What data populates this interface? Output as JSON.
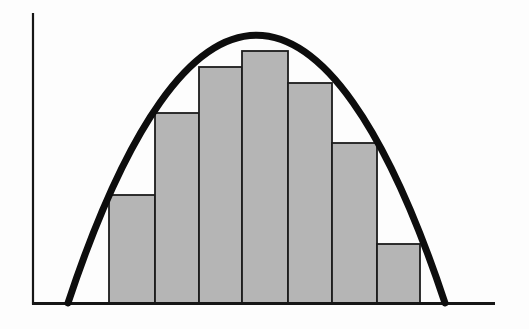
{
  "figure": {
    "kind": "riemann-lower-sum-diagram",
    "canvas": {
      "width": 529,
      "height": 329,
      "background": "#fdfdfd"
    },
    "axes": {
      "color": "#161616",
      "y_axis": {
        "x": 33,
        "y1": 13,
        "y2": 304.5,
        "stroke_width": 2.2
      },
      "x_axis": {
        "y": 303.5,
        "x1": 32,
        "x2": 495,
        "stroke_width": 2.8
      }
    },
    "curve": {
      "color": "#0d0d0d",
      "stroke_width": 7,
      "path": "M 68 303 C 186.5 -54 326.5 -54 445 303",
      "peak": {
        "x": 256.5,
        "y": 35
      },
      "x_intercepts": [
        68,
        445
      ]
    },
    "bars": {
      "fill": "#b5b5b5",
      "stroke": "#1c1c1c",
      "stroke_width": 1.8,
      "baseline_y": 303,
      "items": [
        {
          "x": 109,
          "width": 46,
          "top": 195
        },
        {
          "x": 155,
          "width": 44,
          "top": 113
        },
        {
          "x": 199,
          "width": 43,
          "top": 67
        },
        {
          "x": 242,
          "width": 46,
          "top": 51
        },
        {
          "x": 288,
          "width": 44,
          "top": 83
        },
        {
          "x": 332,
          "width": 45,
          "top": 143
        },
        {
          "x": 377,
          "width": 43,
          "top": 244
        }
      ]
    }
  }
}
